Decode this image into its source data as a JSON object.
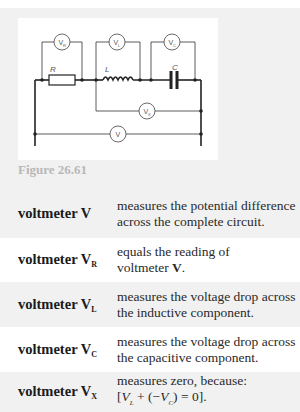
{
  "figure": {
    "caption": "Figure 26.61",
    "components": {
      "resistor_label": "R",
      "inductor_label": "L",
      "capacitor_label": "C"
    },
    "voltmeters": {
      "vr": {
        "symbol": "V",
        "sub": "R"
      },
      "vl": {
        "symbol": "V",
        "sub": "L"
      },
      "vc": {
        "symbol": "V",
        "sub": "C"
      },
      "vx": {
        "symbol": "V",
        "sub": "X"
      },
      "v": {
        "symbol": "V",
        "sub": ""
      }
    }
  },
  "table": {
    "rows": [
      {
        "label": "voltmeter V",
        "label_sub": "",
        "desc_line1": "measures the potential difference",
        "desc_line2": "across the complete circuit."
      },
      {
        "label": "voltmeter V",
        "label_sub": "R",
        "desc_line1": "equals the reading of",
        "desc_line2_prefix": "voltmeter ",
        "desc_line2_bold": "V",
        "desc_line2_suffix": "."
      },
      {
        "label": "voltmeter V",
        "label_sub": "L",
        "desc_line1": "measures the voltage drop across",
        "desc_line2": "the inductive component."
      },
      {
        "label": "voltmeter V",
        "label_sub": "C",
        "desc_line1": "measures the voltage drop across",
        "desc_line2": "the capacitive component."
      },
      {
        "label": "voltmeter V",
        "label_sub": "X",
        "desc_line1": "measures zero, because:",
        "formula": {
          "open": "[",
          "v1": "V",
          "v1_sub": "L",
          "mid": " + (−",
          "v2": "V",
          "v2_sub": "C",
          "close": ") = 0]."
        }
      }
    ]
  }
}
